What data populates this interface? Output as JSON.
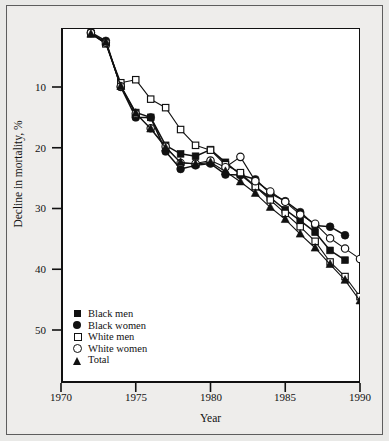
{
  "figure": {
    "background_color": "#e9e9e7",
    "plot_background_color": "#ffffff",
    "frame_color": "#111111"
  },
  "axes": {
    "y_title": "Decline in mortality, %",
    "x_title": "Year",
    "y_ticks": [
      "10",
      "20",
      "30",
      "40",
      "50"
    ],
    "x_ticks": [
      "1970",
      "1975",
      "1980",
      "1985",
      "1990"
    ]
  },
  "legend": {
    "items": [
      {
        "label": "Black men",
        "marker": "filled-square",
        "marker_name": "filled-square-marker-icon"
      },
      {
        "label": "Black women",
        "marker": "filled-circle",
        "marker_name": "filled-circle-marker-icon"
      },
      {
        "label": "White men",
        "marker": "open-square",
        "marker_name": "open-square-marker-icon"
      },
      {
        "label": "White women",
        "marker": "open-circle",
        "marker_name": "open-circle-marker-icon"
      },
      {
        "label": "Total",
        "marker": "filled-triangle",
        "marker_name": "filled-triangle-marker-icon"
      }
    ]
  },
  "chart_data": {
    "type": "line",
    "title": "",
    "xlabel": "Year",
    "ylabel": "Decline in mortality, %",
    "xlim": [
      1970,
      1990
    ],
    "ylim": [
      0,
      55
    ],
    "y_inverted": true,
    "grid": false,
    "legend_position": "bottom-left-inside",
    "x_ticks": [
      1970,
      1975,
      1980,
      1985,
      1990
    ],
    "y_ticks": [
      10,
      20,
      30,
      40,
      50
    ],
    "x": [
      1972,
      1973,
      1974,
      1975,
      1976,
      1977,
      1978,
      1979,
      1980,
      1981,
      1982,
      1983,
      1984,
      1985,
      1986,
      1987,
      1988,
      1989,
      1990
    ],
    "series": [
      {
        "name": "Black men",
        "marker": "filled-square",
        "color": "#111111",
        "values": [
          1.2,
          2.8,
          9.8,
          14.2,
          15.0,
          19.6,
          21.0,
          21.4,
          20.3,
          22.4,
          24.4,
          26.4,
          28.2,
          30.2,
          32.0,
          33.9,
          36.9,
          38.5,
          null
        ]
      },
      {
        "name": "Black women",
        "marker": "filled-circle",
        "color": "#111111",
        "values": [
          1.0,
          2.4,
          10.0,
          15.0,
          15.0,
          20.6,
          23.5,
          22.9,
          22.6,
          24.4,
          24.5,
          25.2,
          27.5,
          28.8,
          30.6,
          32.8,
          33.0,
          34.4,
          null
        ]
      },
      {
        "name": "White men",
        "marker": "open-square",
        "color": "#111111",
        "values": [
          1.2,
          2.9,
          9.3,
          8.8,
          12.0,
          13.4,
          17.0,
          19.6,
          20.4,
          22.8,
          24.1,
          26.4,
          28.6,
          30.8,
          33.0,
          35.4,
          38.8,
          41.2,
          44.5
        ]
      },
      {
        "name": "White women",
        "marker": "open-circle",
        "color": "#111111",
        "values": [
          1.1,
          2.7,
          9.9,
          14.4,
          16.8,
          19.8,
          22.5,
          22.6,
          22.1,
          23.2,
          21.5,
          25.5,
          27.2,
          28.9,
          31.0,
          32.5,
          34.9,
          36.6,
          38.3
        ]
      },
      {
        "name": "Total",
        "marker": "filled-triangle",
        "color": "#111111",
        "values": [
          1.3,
          2.6,
          9.9,
          14.3,
          16.9,
          20.0,
          22.4,
          22.7,
          22.4,
          23.9,
          25.6,
          27.5,
          29.8,
          31.8,
          34.2,
          36.5,
          39.2,
          41.8,
          45.2
        ]
      }
    ]
  }
}
